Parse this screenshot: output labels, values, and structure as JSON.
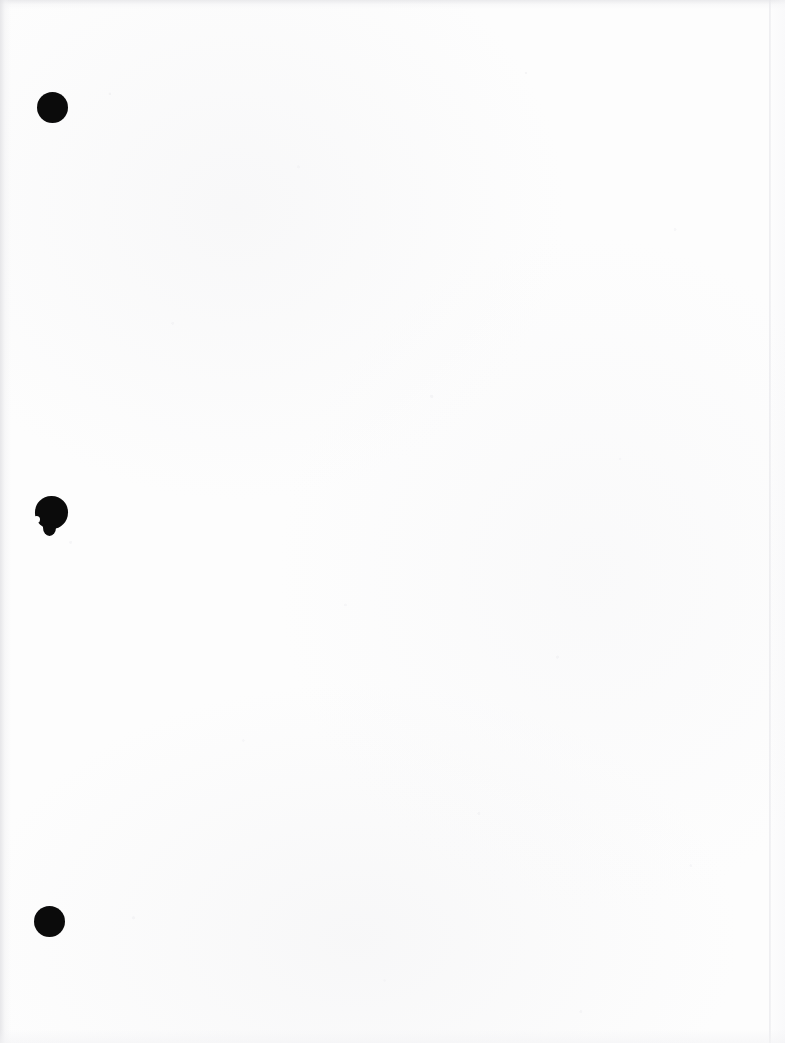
{
  "document": {
    "page_kind": "blank-scanned-page",
    "page_content_text": "",
    "visible_text": "",
    "background_color": "#fdfdfd",
    "ink_color": "#0b0b0b",
    "page_width_px": 785,
    "page_height_px": 1043
  },
  "punch_holes": {
    "count": 3,
    "edge": "left",
    "items": [
      {
        "label": "top-punch-hole",
        "center_x": 52,
        "center_y": 107,
        "diameter": 31,
        "irregular": false
      },
      {
        "label": "middle-punch-hole",
        "center_x": 51,
        "center_y": 512,
        "diameter": 33,
        "irregular": true
      },
      {
        "label": "bottom-punch-hole",
        "center_x": 49,
        "center_y": 921,
        "diameter": 31,
        "irregular": false
      }
    ]
  },
  "scan_artifacts": {
    "left_edge_shadow": true,
    "top_edge_shadow": true,
    "right_edge_line": true,
    "bottom_edge_shadow": true,
    "paper_speckle": true
  }
}
